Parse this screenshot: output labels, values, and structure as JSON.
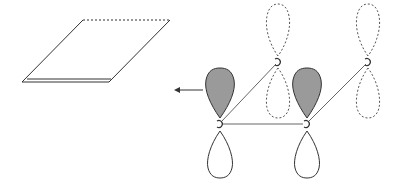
{
  "diagram": {
    "title": "",
    "colors": {
      "background": "#ffffff",
      "stroke": "#333333",
      "shaded_lobe": "#9a9a9a",
      "dashed_stroke": "#555555"
    },
    "plane": {
      "points": [
        [
          22,
          82
        ],
        [
          83,
          20
        ],
        [
          170,
          20
        ],
        [
          109,
          82
        ]
      ],
      "dashed_top": true
    },
    "arrow": {
      "from": [
        203,
        90
      ],
      "to": [
        174,
        90
      ],
      "direction": "left"
    },
    "atoms": [
      {
        "id": "a1",
        "x": 220,
        "y": 124,
        "upper_lobe": "shaded",
        "lower_lobe": "solid"
      },
      {
        "id": "a2",
        "x": 307,
        "y": 124,
        "upper_lobe": "shaded",
        "lower_lobe": "solid"
      },
      {
        "id": "b1",
        "x": 278,
        "y": 62,
        "upper_lobe": "dashed",
        "lower_lobe": "dashed"
      },
      {
        "id": "b2",
        "x": 368,
        "y": 62,
        "upper_lobe": "dashed",
        "lower_lobe": "dashed"
      }
    ],
    "bonds": [
      [
        "a1",
        "a2"
      ],
      [
        "a1",
        "b1"
      ],
      [
        "a2",
        "b2"
      ]
    ]
  }
}
